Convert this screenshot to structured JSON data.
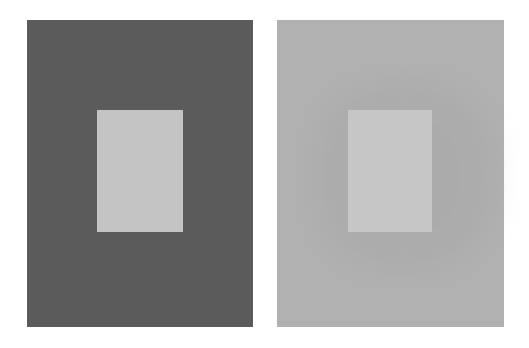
{
  "figure": {
    "background": "#ffffff",
    "panels": [
      {
        "id": "left",
        "surround_color": "#5b5b5b",
        "target_color": "#c4c4c4",
        "rect": {
          "x": 27,
          "y": 20,
          "w": 226,
          "h": 307
        },
        "target_rect": {
          "x": 97,
          "y": 110,
          "w": 86,
          "h": 122
        }
      },
      {
        "id": "right",
        "surround_color": "#b1b1b1",
        "target_color": "#c6c6c6",
        "halo_color": "#a2a2a2",
        "rect": {
          "x": 277,
          "y": 20,
          "w": 227,
          "h": 307
        },
        "target_rect": {
          "x": 348,
          "y": 110,
          "w": 84,
          "h": 122
        }
      }
    ]
  }
}
